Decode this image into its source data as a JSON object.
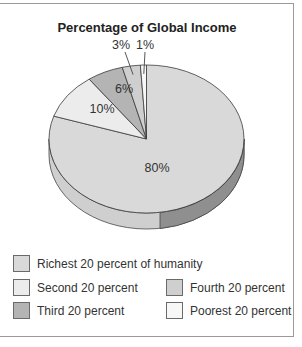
{
  "chart_data": {
    "type": "pie",
    "title": "Percentage of Global Income",
    "style": "3d-pie",
    "categories": [
      "Richest 20 percent of humanity",
      "Second 20 percent",
      "Third 20 percent",
      "Fourth 20 percent",
      "Poorest 20 percent"
    ],
    "values": [
      80,
      10,
      6,
      3,
      1
    ],
    "labels": [
      "80%",
      "10%",
      "6%",
      "3%",
      "1%"
    ],
    "colors": [
      "#d9d9d9",
      "#ececec",
      "#b4b4b4",
      "#cfcfcf",
      "#f7f7f7"
    ],
    "legend_position": "bottom",
    "xlabel": "",
    "ylabel": ""
  },
  "legend": {
    "items": [
      {
        "label": "Richest 20 percent of humanity",
        "color": "#d9d9d9"
      },
      {
        "label": "Second 20 percent",
        "color": "#ececec"
      },
      {
        "label": "Third 20 percent",
        "color": "#b4b4b4"
      },
      {
        "label": "Fourth 20 percent",
        "color": "#cfcfcf"
      },
      {
        "label": "Poorest 20 percent",
        "color": "#f7f7f7"
      }
    ]
  }
}
